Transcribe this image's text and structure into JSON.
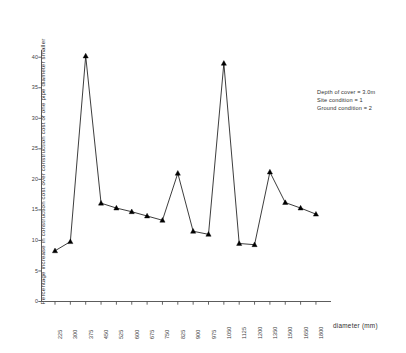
{
  "chart_data": {
    "type": "line",
    "title": "",
    "subtitle": "",
    "xlabel": "diameter (mm)",
    "ylabel": "Percentage increase in construction cost over construction cost of one pipe diameter smaller",
    "categories": [
      "225",
      "300",
      "375",
      "450",
      "525",
      "600",
      "675",
      "750",
      "825",
      "900",
      "975",
      "1050",
      "1125",
      "1200",
      "1350",
      "1500",
      "1650",
      "1800"
    ],
    "values": [
      8.3,
      9.8,
      40.2,
      16.1,
      15.3,
      14.7,
      14.0,
      13.3,
      21.0,
      11.5,
      11.0,
      39.0,
      9.5,
      9.3,
      21.2,
      16.2,
      15.3,
      14.3
    ],
    "series": [
      {
        "name": "Percentage increase in construction cost",
        "values": [
          8.3,
          9.8,
          40.2,
          16.1,
          15.3,
          14.7,
          14.0,
          13.3,
          21.0,
          11.5,
          11.0,
          39.0,
          9.5,
          9.3,
          21.2,
          16.2,
          15.3,
          14.3
        ]
      }
    ],
    "yticks": [
      "0",
      "5",
      "10",
      "15",
      "20",
      "25",
      "30",
      "35",
      "40"
    ],
    "ytick_values": [
      0,
      5,
      10,
      15,
      20,
      25,
      30,
      35,
      40
    ],
    "ylim": [
      0,
      42
    ],
    "xlim": [
      0,
      19
    ],
    "grid": false,
    "legend_position": "none",
    "marker": "triangle",
    "line_color": "#1a1a1a",
    "marker_color": "#000000",
    "axis_color": "#4a4a4a",
    "background_color": "#ffffff"
  },
  "annotation": {
    "line1": "Depth of cover = 3.0m",
    "line2": "Site condition = 1",
    "line3": "Ground condition = 2"
  },
  "axis": {
    "x_title": "diameter (mm)",
    "y_title": "Percentage increase in construction cost over construction cost of one pipe diameter smaller"
  }
}
